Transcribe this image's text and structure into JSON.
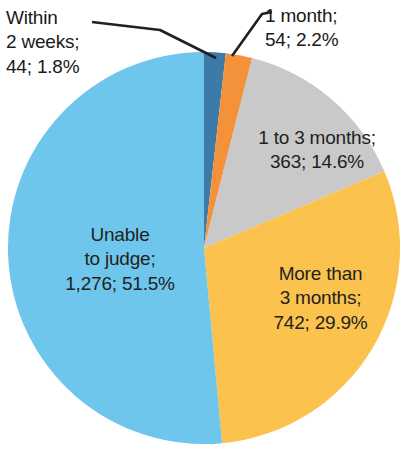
{
  "chart_data": {
    "type": "pie",
    "title": "",
    "subtitle": "",
    "xlabel": "",
    "ylabel": "",
    "legend_position": "none",
    "grid": false,
    "total": 2479,
    "start_angle_deg": 0,
    "direction": "clockwise",
    "categories": [
      "Within 2 weeks",
      "1 month",
      "1 to 3 months",
      "More than 3 months",
      "Unable to judge"
    ],
    "values": [
      44,
      54,
      363,
      742,
      1276
    ],
    "percentages": [
      1.8,
      2.2,
      14.6,
      29.9,
      51.5
    ],
    "colors": [
      "#3c7aa8",
      "#f4923c",
      "#c9c9c9",
      "#fbc24e",
      "#6ec6ec"
    ],
    "slices": [
      {
        "name": "Within 2 weeks",
        "value": 44,
        "value_text": "44",
        "percent": 1.8,
        "percent_text": "1.8%",
        "color": "#3c7aa8",
        "label_text": "Within\n2 weeks;\n44; 1.8%",
        "label_placement": "callout-outside",
        "label_color": "#231f20"
      },
      {
        "name": "1 month",
        "value": 54,
        "value_text": "54",
        "percent": 2.2,
        "percent_text": "2.2%",
        "color": "#f4923c",
        "label_text": "1 month;\n54; 2.2%",
        "label_placement": "callout-outside",
        "label_color": "#231f20"
      },
      {
        "name": "1 to 3 months",
        "value": 363,
        "value_text": "363",
        "percent": 14.6,
        "percent_text": "14.6%",
        "color": "#c9c9c9",
        "label_text": "1 to 3 months;\n363; 14.6%",
        "label_placement": "inside",
        "label_color": "#231f20"
      },
      {
        "name": "More than 3 months",
        "value": 742,
        "value_text": "742",
        "percent": 29.9,
        "percent_text": "29.9%",
        "color": "#fbc24e",
        "label_text": "More than\n3 months;\n742; 29.9%",
        "label_placement": "inside",
        "label_color": "#231f20"
      },
      {
        "name": "Unable to judge",
        "value": 1276,
        "value_text": "1,276",
        "percent": 51.5,
        "percent_text": "51.5%",
        "color": "#6ec6ec",
        "label_text": "Unable\nto judge;\n1,276; 51.5%",
        "label_placement": "inside",
        "label_color": "#231f20"
      }
    ]
  },
  "labels": {
    "within_2_weeks": "Within\n2 weeks;\n44; 1.8%",
    "one_month": "1 month;\n54; 2.2%",
    "one_to_three_months": "1 to 3 months;\n363; 14.6%",
    "more_than_three_months": "More than\n3 months;\n742; 29.9%",
    "unable_to_judge": "Unable\nto judge;\n1,276; 51.5%"
  },
  "geometry": {
    "center_x": 204,
    "center_y": 248,
    "radius": 196,
    "leader_color": "#231f20"
  }
}
